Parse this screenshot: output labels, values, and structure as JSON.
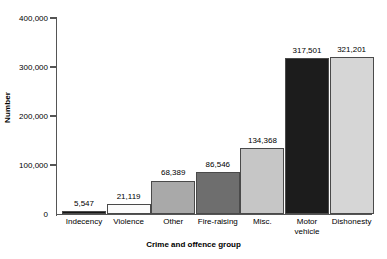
{
  "chart_data": {
    "type": "bar",
    "title": "",
    "xlabel": "Crime and offence group",
    "ylabel": "Number",
    "categories": [
      "Indecency",
      "Violence",
      "Other",
      "Fire-raising",
      "Misc.",
      "Motor vehicle",
      "Dishonesty"
    ],
    "values": [
      5547,
      21119,
      68389,
      86546,
      134368,
      317501,
      321201
    ],
    "value_labels": [
      "5,547",
      "21,119",
      "68,389",
      "86,546",
      "134,368",
      "317,501",
      "321,201"
    ],
    "bar_colors": [
      "#151515",
      "#fbfbfb",
      "#a9a9a9",
      "#6e6e6e",
      "#c6c6c6",
      "#1c1c1c",
      "#d6d6d6"
    ],
    "bar_border_color": "#4a4a4a",
    "ylim": [
      0,
      400000
    ],
    "ytick_values": [
      0,
      100000,
      200000,
      300000,
      400000
    ],
    "ytick_labels": [
      "0",
      "100,000",
      "200,000",
      "300,000",
      "400,000"
    ],
    "grid": false,
    "legend": null,
    "axis_color": "#555555",
    "background": "#ffffff"
  }
}
